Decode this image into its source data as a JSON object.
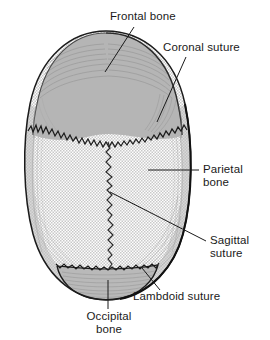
{
  "figure": {
    "background_color": "#ffffff",
    "line_color": "#1a1a1a"
  },
  "labels": [
    {
      "id": "frontal-bone",
      "text": "Frontal bone",
      "lines": [
        "Frontal bone"
      ]
    },
    {
      "id": "coronal-suture",
      "text": "Coronal suture",
      "lines": [
        "Coronal suture"
      ]
    },
    {
      "id": "parietal-bone",
      "text": "Parietal bone",
      "lines": [
        "Parietal",
        "bone"
      ],
      "line1": "Parietal",
      "line2": "bone"
    },
    {
      "id": "sagittal-suture",
      "text": "Sagittal suture",
      "lines": [
        "Sagittal",
        "suture"
      ],
      "line1": "Sagittal",
      "line2": "suture"
    },
    {
      "id": "lambdoid-suture",
      "text": "Lambdoid suture",
      "lines": [
        "Lambdoid suture"
      ]
    },
    {
      "id": "occipital-bone",
      "text": "Occipital bone",
      "lines": [
        "Occipital",
        "bone"
      ],
      "line1": "Occipital",
      "line2": "bone"
    }
  ],
  "structures": {
    "frontal_bone": {
      "name": "Frontal bone",
      "fill_color": "#b3b3b3",
      "texture": "solid-gray-with-radial-hatching"
    },
    "parietal_bone": {
      "name": "Parietal bone",
      "fill_color": "#e8e8e8",
      "texture": "fine-stipple-dots"
    },
    "occipital_bone": {
      "name": "Occipital bone",
      "fill_color": "#b8b8b8",
      "texture": "solid-gray-with-horizontal-hatching"
    },
    "coronal_suture": {
      "name": "Coronal suture",
      "texture": "jagged-sawtooth-line"
    },
    "sagittal_suture": {
      "name": "Sagittal suture",
      "texture": "vertical-wavy-zigzag-line"
    },
    "lambdoid_suture": {
      "name": "Lambdoid suture",
      "texture": "jagged-arc-line"
    }
  }
}
